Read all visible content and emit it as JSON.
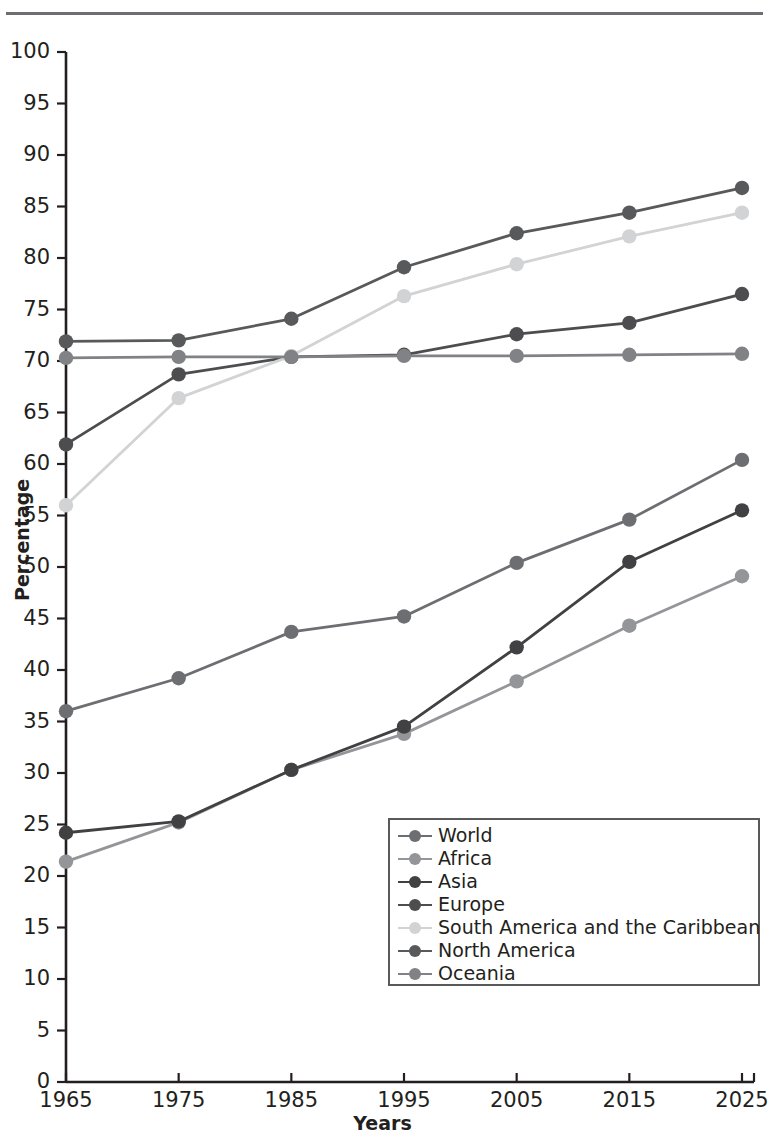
{
  "figure": {
    "top_rule": "horizontal-rule"
  },
  "chart_data": {
    "type": "line",
    "title": "",
    "xlabel": "Years",
    "ylabel": "Percentage",
    "x": [
      1965,
      1975,
      1985,
      1995,
      2005,
      2015,
      2025
    ],
    "xtick_labels": [
      "1965",
      "1975",
      "1985",
      "1995",
      "2005",
      "2015",
      "2025"
    ],
    "ytick_labels": [
      "0",
      "5",
      "10",
      "15",
      "20",
      "25",
      "30",
      "35",
      "40",
      "45",
      "50",
      "55",
      "60",
      "65",
      "70",
      "75",
      "80",
      "85",
      "90",
      "95",
      "100"
    ],
    "ylim": [
      0,
      100
    ],
    "xlim": [
      1965,
      2025
    ],
    "ytick_step": 5,
    "grid": false,
    "legend_position": "lower-right-inside",
    "series": [
      {
        "name": "World",
        "color": "#6d6e71",
        "values": [
          36.0,
          39.2,
          43.7,
          45.2,
          50.4,
          54.6,
          60.4
        ]
      },
      {
        "name": "Africa",
        "color": "#939598",
        "values": [
          21.4,
          25.2,
          30.3,
          33.8,
          38.9,
          44.3,
          49.1
        ]
      },
      {
        "name": "Asia",
        "color": "#414042",
        "values": [
          24.2,
          25.3,
          30.3,
          34.5,
          42.2,
          50.5,
          55.5
        ]
      },
      {
        "name": "Europe",
        "color": "#4d4d4f",
        "values": [
          61.9,
          68.7,
          70.4,
          70.6,
          72.6,
          73.7,
          76.5
        ]
      },
      {
        "name": "South America and the Caribbean",
        "color": "#d1d3d4",
        "values": [
          56.0,
          66.4,
          70.5,
          76.3,
          79.4,
          82.1,
          84.4
        ]
      },
      {
        "name": "North America",
        "color": "#58595b",
        "values": [
          71.9,
          72.0,
          74.1,
          79.1,
          82.4,
          84.4,
          86.8
        ]
      },
      {
        "name": "Oceania",
        "color": "#808285",
        "values": [
          70.3,
          70.4,
          70.4,
          70.5,
          70.5,
          70.6,
          70.7
        ]
      }
    ]
  }
}
